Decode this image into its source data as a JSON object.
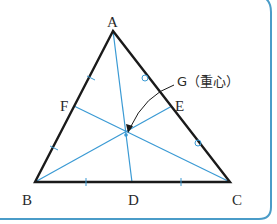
{
  "figure": {
    "vertices": {
      "A": "A",
      "B": "B",
      "C": "C"
    },
    "midpoints": {
      "D": "D",
      "E": "E",
      "F": "F"
    },
    "centroid_label": "G（重心）",
    "colors": {
      "frame": "#4a9cc8",
      "triangle": "#1a1a1a",
      "median": "#3a9ad4"
    }
  }
}
